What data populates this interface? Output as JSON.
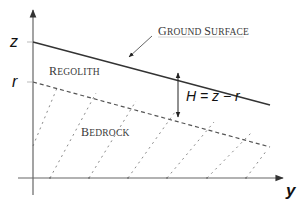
{
  "diagram": {
    "axes": {
      "vertical_label": "z",
      "horizontal_label": "y",
      "level_label_r": "r"
    },
    "labels": {
      "ground_surface_first": "G",
      "ground_surface_rest": "ROUND ",
      "ground_surface_second": "S",
      "ground_surface_rest2": "URFACE",
      "regolith_first": "R",
      "regolith_rest": "EGOLITH",
      "bedrock_first": "B",
      "bedrock_rest": "EDROCK",
      "thickness_formula": "H = z − r"
    },
    "lines": {
      "ground_surface": {
        "x1": 33,
        "y1": 42,
        "x2": 270,
        "y2": 105,
        "style": "solid"
      },
      "bedrock_surface": {
        "x1": 33,
        "y1": 82,
        "x2": 270,
        "y2": 147,
        "style": "dashed"
      },
      "hatch_count": 6
    },
    "colors": {
      "line": "#333333",
      "axis": "#555555",
      "hatch": "#888888"
    }
  }
}
